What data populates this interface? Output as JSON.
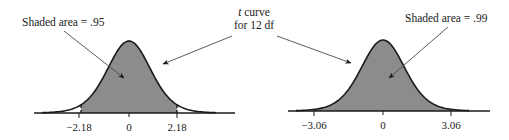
{
  "figure": {
    "center_label": {
      "line1_italic": "t",
      "line1_rest": " curve",
      "line2": "for 12 df"
    },
    "panels": [
      {
        "id": "left",
        "shaded_area_label": "Shaded area = .95",
        "cutoff_style": "dashed",
        "ticks": [
          "−2.18",
          "0",
          "2.18"
        ]
      },
      {
        "id": "right",
        "shaded_area_label": "Shaded area = .99",
        "cutoff_style": "solid",
        "ticks": [
          "−3.06",
          "0",
          "3.06"
        ]
      }
    ],
    "colors": {
      "shade": "#8c8c8c",
      "curve": "#1a1a1a",
      "arrow": "#4a4a4a"
    }
  },
  "chart_data": [
    {
      "type": "area",
      "title": "t curve for 12 df",
      "df": 12,
      "shaded_area": 0.95,
      "critical_values": [
        -2.18,
        2.18
      ],
      "x_tick_labels": [
        "-2.18",
        "0",
        "2.18"
      ],
      "annotation": "Shaded area = .95"
    },
    {
      "type": "area",
      "title": "t curve for 12 df",
      "df": 12,
      "shaded_area": 0.99,
      "critical_values": [
        -3.06,
        3.06
      ],
      "x_tick_labels": [
        "-3.06",
        "0",
        "3.06"
      ],
      "annotation": "Shaded area = .99"
    }
  ]
}
